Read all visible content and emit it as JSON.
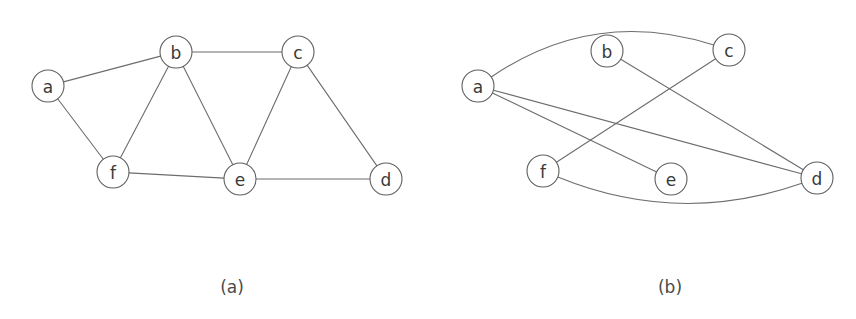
{
  "figure": {
    "background_color": "#ffffff",
    "edge_color": "#6d6d6d",
    "node_stroke_color": "#5f5f5f",
    "node_fill_color": "#ffffff",
    "label_color": "#3a3a3a",
    "node_radius": 16
  },
  "panels": [
    {
      "id": "panel-a",
      "caption": "(a)",
      "caption_x": 232,
      "caption_y": 287,
      "nodes": [
        {
          "id": "a",
          "label": "a",
          "x": 48,
          "y": 86
        },
        {
          "id": "b",
          "label": "b",
          "x": 176,
          "y": 52
        },
        {
          "id": "c",
          "label": "c",
          "x": 298,
          "y": 52
        },
        {
          "id": "d",
          "label": "d",
          "x": 386,
          "y": 179
        },
        {
          "id": "e",
          "label": "e",
          "x": 240,
          "y": 179
        },
        {
          "id": "f",
          "label": "f",
          "x": 113,
          "y": 172
        }
      ],
      "edges": [
        {
          "from": "a",
          "to": "b",
          "kind": "line"
        },
        {
          "from": "a",
          "to": "f",
          "kind": "line"
        },
        {
          "from": "b",
          "to": "c",
          "kind": "line"
        },
        {
          "from": "b",
          "to": "f",
          "kind": "line"
        },
        {
          "from": "b",
          "to": "e",
          "kind": "line"
        },
        {
          "from": "c",
          "to": "e",
          "kind": "line"
        },
        {
          "from": "c",
          "to": "d",
          "kind": "line"
        },
        {
          "from": "f",
          "to": "e",
          "kind": "line"
        },
        {
          "from": "e",
          "to": "d",
          "kind": "line"
        }
      ]
    },
    {
      "id": "panel-b",
      "caption": "(b)",
      "caption_x": 670,
      "caption_y": 287,
      "nodes": [
        {
          "id": "a",
          "label": "a",
          "x": 478,
          "y": 86
        },
        {
          "id": "b",
          "label": "b",
          "x": 607,
          "y": 51
        },
        {
          "id": "c",
          "label": "c",
          "x": 729,
          "y": 50
        },
        {
          "id": "d",
          "label": "d",
          "x": 817,
          "y": 178
        },
        {
          "id": "e",
          "label": "e",
          "x": 671,
          "y": 179
        },
        {
          "id": "f",
          "label": "f",
          "x": 543,
          "y": 171
        }
      ],
      "edges": [
        {
          "from": "a",
          "to": "c",
          "kind": "arc",
          "bow": -62
        },
        {
          "from": "a",
          "to": "d",
          "kind": "line"
        },
        {
          "from": "a",
          "to": "e",
          "kind": "line"
        },
        {
          "from": "b",
          "to": "d",
          "kind": "line"
        },
        {
          "from": "c",
          "to": "f",
          "kind": "line"
        },
        {
          "from": "f",
          "to": "d",
          "kind": "arc",
          "bow": 52
        }
      ]
    }
  ]
}
